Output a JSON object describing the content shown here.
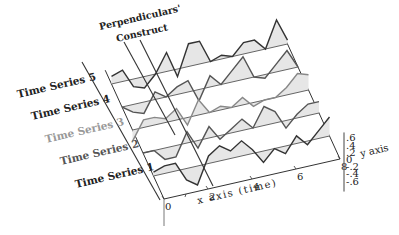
{
  "chart_data": {
    "type": "line",
    "subtype": "3d-stacked-time-series-with-shaded-deviation",
    "title": "",
    "annotation": "Perpendiculars' Construct",
    "annotation_lines": [
      "Perpendiculars'",
      "Construct"
    ],
    "xlabel": "x axis (time)",
    "ylabel": "y axis",
    "x_ticks": [
      "0",
      "2",
      "4",
      "6",
      "8"
    ],
    "y_ticks": [
      ".6",
      ".4",
      ".2",
      "0",
      "-.2",
      "-.4",
      "-.6"
    ],
    "xlim": [
      0,
      8
    ],
    "ylim": [
      -0.6,
      0.6
    ],
    "grid": false,
    "legend": "none",
    "x": [
      0,
      0.5,
      1,
      1.5,
      2,
      2.5,
      3,
      3.5,
      4,
      4.5,
      5,
      5.5,
      6,
      6.5,
      7,
      7.5,
      8
    ],
    "series": [
      {
        "name": "Time Series 1",
        "color": "#333333",
        "values": [
          0.1,
          0.2,
          0.2,
          -0.3,
          -0.5,
          0.2,
          0.4,
          0.2,
          0.4,
          0.1,
          -0.3,
          0.0,
          -0.2,
          0.2,
          -0.1,
          0.2,
          0.5
        ]
      },
      {
        "name": "Time Series 2",
        "color": "#555555",
        "values": [
          0.0,
          0.0,
          -0.3,
          -0.3,
          0.3,
          -0.2,
          0.3,
          -0.1,
          0.1,
          0.3,
          0.0,
          0.5,
          0.3,
          -0.2,
          0.1,
          0.3,
          0.3
        ]
      },
      {
        "name": "Time Series 3",
        "color": "#888888",
        "values": [
          -0.3,
          0.2,
          0.2,
          0.1,
          0.3,
          -0.2,
          0.4,
          0.0,
          0.1,
          0.0,
          0.2,
          -0.1,
          0.0,
          0.0,
          0.2,
          0.5,
          0.4
        ]
      },
      {
        "name": "Time Series 4",
        "color": "#555555",
        "values": [
          0.0,
          -0.2,
          -0.3,
          0.2,
          0.0,
          0.2,
          0.3,
          -0.3,
          0.3,
          0.0,
          0.3,
          0.6,
          0.0,
          -0.1,
          0.2,
          0.5,
          0.0
        ]
      },
      {
        "name": "Time Series 5",
        "color": "#333333",
        "values": [
          0.2,
          0.3,
          -0.2,
          -0.3,
          0.0,
          0.5,
          -0.2,
          0.6,
          0.6,
          0.0,
          0.1,
          0.0,
          0.3,
          0.3,
          0.0,
          0.7,
          0.1
        ]
      }
    ]
  }
}
